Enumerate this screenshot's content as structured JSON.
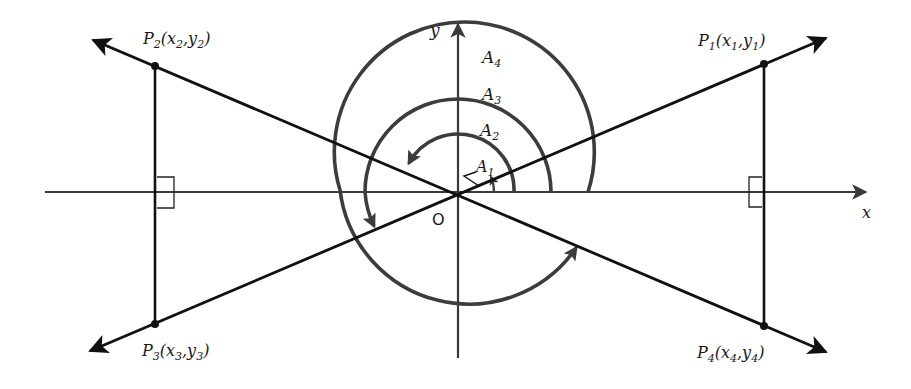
{
  "diagram": {
    "origin_label": "O",
    "x_axis_label": "x",
    "y_axis_label": "y",
    "points": [
      {
        "name": "P",
        "sub": "1",
        "coords": "(x₁,y₁)",
        "x_sub": "1",
        "y_sub": "1"
      },
      {
        "name": "P",
        "sub": "2",
        "coords": "(x₂,y₂)",
        "x_sub": "2",
        "y_sub": "2"
      },
      {
        "name": "P",
        "sub": "3",
        "coords": "(x₃,y₃)",
        "x_sub": "3",
        "y_sub": "3"
      },
      {
        "name": "P",
        "sub": "4",
        "coords": "(x₄,y₄)",
        "x_sub": "4",
        "y_sub": "4"
      }
    ],
    "angles": [
      {
        "name": "A",
        "sub": "1"
      },
      {
        "name": "A",
        "sub": "2"
      },
      {
        "name": "A",
        "sub": "3"
      },
      {
        "name": "A",
        "sub": "4"
      }
    ],
    "colors": {
      "lines": "#111111",
      "arcs": "#3c3c3c",
      "axes": "#3a3a3a",
      "background": "#ffffff"
    }
  }
}
